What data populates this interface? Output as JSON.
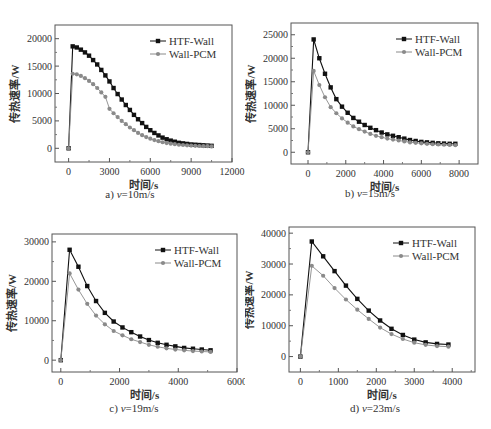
{
  "figure": {
    "legend": [
      "HTF-Wall",
      "Wall-PCM"
    ],
    "xlabel": "时间/s",
    "ylabel": "传热速率/W",
    "colors": {
      "HTF-Wall": "#111111",
      "Wall-PCM": "#8a8a8a"
    },
    "footer_caption": ""
  },
  "chart_data": [
    {
      "id": "a",
      "type": "line",
      "caption": "a) v=10m/s",
      "caption_prefix": "a) ",
      "caption_var": "v",
      "caption_suffix": "=10m/s",
      "xlabel": "时间/s",
      "ylabel": "传热速率/W",
      "xlim": [
        -1000,
        12000
      ],
      "ylim": [
        -2500,
        22500
      ],
      "xticks": [
        0,
        3000,
        6000,
        9000,
        12000
      ],
      "yticks": [
        0,
        5000,
        10000,
        15000,
        20000
      ],
      "legend_position": "upper right",
      "grid": false,
      "series": [
        {
          "name": "HTF-Wall",
          "x": [
            0,
            300,
            600,
            900,
            1200,
            1500,
            1800,
            2100,
            2400,
            2700,
            3000,
            3300,
            3600,
            3900,
            4200,
            4500,
            4800,
            5100,
            5400,
            5700,
            6000,
            6300,
            6600,
            6900,
            7200,
            7500,
            7800,
            8100,
            8400,
            8700,
            9000,
            9300,
            9600,
            9900,
            10200,
            10500
          ],
          "values": [
            0,
            18600,
            18400,
            18000,
            17500,
            16900,
            16100,
            15300,
            14300,
            13300,
            12200,
            11000,
            9900,
            8900,
            7900,
            7000,
            6100,
            5300,
            4600,
            3900,
            3300,
            2800,
            2350,
            1950,
            1650,
            1400,
            1200,
            1000,
            900,
            800,
            700,
            650,
            600,
            550,
            500,
            450
          ]
        },
        {
          "name": "Wall-PCM",
          "x": [
            0,
            300,
            600,
            900,
            1200,
            1500,
            1800,
            2100,
            2400,
            2700,
            3000,
            3300,
            3600,
            3900,
            4200,
            4500,
            4800,
            5100,
            5400,
            5700,
            6000,
            6300,
            6600,
            6900,
            7200,
            7500,
            7800,
            8100,
            8400,
            8700,
            9000,
            9300,
            9600,
            9900,
            10200,
            10500
          ],
          "values": [
            0,
            13600,
            13500,
            13200,
            12800,
            12300,
            11700,
            11000,
            10200,
            9400,
            7200,
            6400,
            5700,
            5000,
            4400,
            3800,
            3300,
            2800,
            2400,
            2050,
            1750,
            1500,
            1300,
            1100,
            950,
            850,
            750,
            650,
            600,
            550,
            500,
            450,
            420,
            400,
            380,
            350
          ]
        }
      ]
    },
    {
      "id": "b",
      "type": "line",
      "caption": "b) v=15m/s",
      "caption_prefix": "b) ",
      "caption_var": "v",
      "caption_suffix": "=15m/s",
      "xlabel": "时间/s",
      "ylabel": "传热速率/W",
      "xlim": [
        -900,
        9000
      ],
      "ylim": [
        -2500,
        27500
      ],
      "xticks": [
        0,
        2000,
        4000,
        6000,
        8000
      ],
      "yticks": [
        0,
        5000,
        10000,
        15000,
        20000,
        25000
      ],
      "legend_position": "upper right",
      "grid": false,
      "series": [
        {
          "name": "HTF-Wall",
          "x": [
            0,
            300,
            600,
            900,
            1200,
            1500,
            1800,
            2100,
            2400,
            2700,
            3000,
            3300,
            3600,
            3900,
            4200,
            4500,
            4800,
            5100,
            5400,
            5700,
            6000,
            6300,
            6600,
            6900,
            7200,
            7500,
            7800
          ],
          "values": [
            0,
            24000,
            20000,
            16700,
            13800,
            11300,
            9700,
            8400,
            7300,
            6500,
            5800,
            5200,
            4700,
            4200,
            3800,
            3500,
            3200,
            2900,
            2600,
            2400,
            2200,
            2100,
            2000,
            1900,
            1850,
            1800,
            1800
          ]
        },
        {
          "name": "Wall-PCM",
          "x": [
            0,
            300,
            600,
            900,
            1200,
            1500,
            1800,
            2100,
            2400,
            2700,
            3000,
            3300,
            3600,
            3900,
            4200,
            4500,
            4800,
            5100,
            5400,
            5700,
            6000,
            6300,
            6600,
            6900,
            7200,
            7500,
            7800
          ],
          "values": [
            0,
            17300,
            14300,
            11700,
            9600,
            8300,
            7200,
            6300,
            5500,
            4900,
            4400,
            3900,
            3500,
            3200,
            2900,
            2700,
            2500,
            2300,
            2100,
            2000,
            1900,
            1800,
            1700,
            1650,
            1600,
            1550,
            1500
          ]
        }
      ]
    },
    {
      "id": "c",
      "type": "line",
      "caption": "c) v=19m/s",
      "caption_prefix": "c) ",
      "caption_var": "v",
      "caption_suffix": "=19m/s",
      "xlabel": "时间/s",
      "ylabel": "传热速率/W",
      "xlim": [
        -300,
        6000
      ],
      "ylim": [
        -3000,
        32000
      ],
      "xticks": [
        0,
        2000,
        4000,
        6000
      ],
      "yticks": [
        0,
        10000,
        20000,
        30000
      ],
      "legend_position": "upper right",
      "grid": false,
      "series": [
        {
          "name": "HTF-Wall",
          "x": [
            0,
            300,
            600,
            900,
            1200,
            1500,
            1800,
            2100,
            2400,
            2700,
            3000,
            3300,
            3600,
            3900,
            4200,
            4500,
            4800,
            5100
          ],
          "values": [
            0,
            28000,
            23700,
            18800,
            15000,
            12000,
            9800,
            8300,
            7100,
            6000,
            5100,
            4400,
            3900,
            3500,
            3100,
            2900,
            2700,
            2500
          ]
        },
        {
          "name": "Wall-PCM",
          "x": [
            0,
            300,
            600,
            900,
            1200,
            1500,
            1800,
            2100,
            2400,
            2700,
            3000,
            3300,
            3600,
            3900,
            4200,
            4500,
            4800,
            5100
          ],
          "values": [
            0,
            22000,
            17900,
            14300,
            11300,
            9100,
            7400,
            6300,
            5300,
            4600,
            3900,
            3400,
            3000,
            2700,
            2500,
            2300,
            2200,
            2100
          ]
        }
      ]
    },
    {
      "id": "d",
      "type": "line",
      "caption": "d) v=23m/s",
      "caption_prefix": "d) ",
      "caption_var": "v",
      "caption_suffix": "=23m/s",
      "xlabel": "时间/s",
      "ylabel": "传热速率/W",
      "xlim": [
        -300,
        4600
      ],
      "ylim": [
        -5000,
        42000
      ],
      "xticks": [
        0,
        1000,
        2000,
        3000,
        4000
      ],
      "yticks": [
        0,
        10000,
        20000,
        30000,
        40000
      ],
      "legend_position": "upper right",
      "grid": false,
      "series": [
        {
          "name": "HTF-Wall",
          "x": [
            0,
            300,
            600,
            900,
            1200,
            1500,
            1800,
            2100,
            2400,
            2700,
            3000,
            3300,
            3600,
            3900
          ],
          "values": [
            0,
            37300,
            32500,
            27700,
            23000,
            18700,
            14900,
            11700,
            9000,
            7000,
            5500,
            4600,
            4100,
            3900
          ]
        },
        {
          "name": "Wall-PCM",
          "x": [
            0,
            300,
            600,
            900,
            1200,
            1500,
            1800,
            2100,
            2400,
            2700,
            3000,
            3300,
            3600,
            3900
          ],
          "values": [
            0,
            29400,
            26200,
            22200,
            18500,
            15200,
            12200,
            9400,
            7300,
            5700,
            4500,
            3800,
            3400,
            3200
          ]
        }
      ]
    }
  ]
}
